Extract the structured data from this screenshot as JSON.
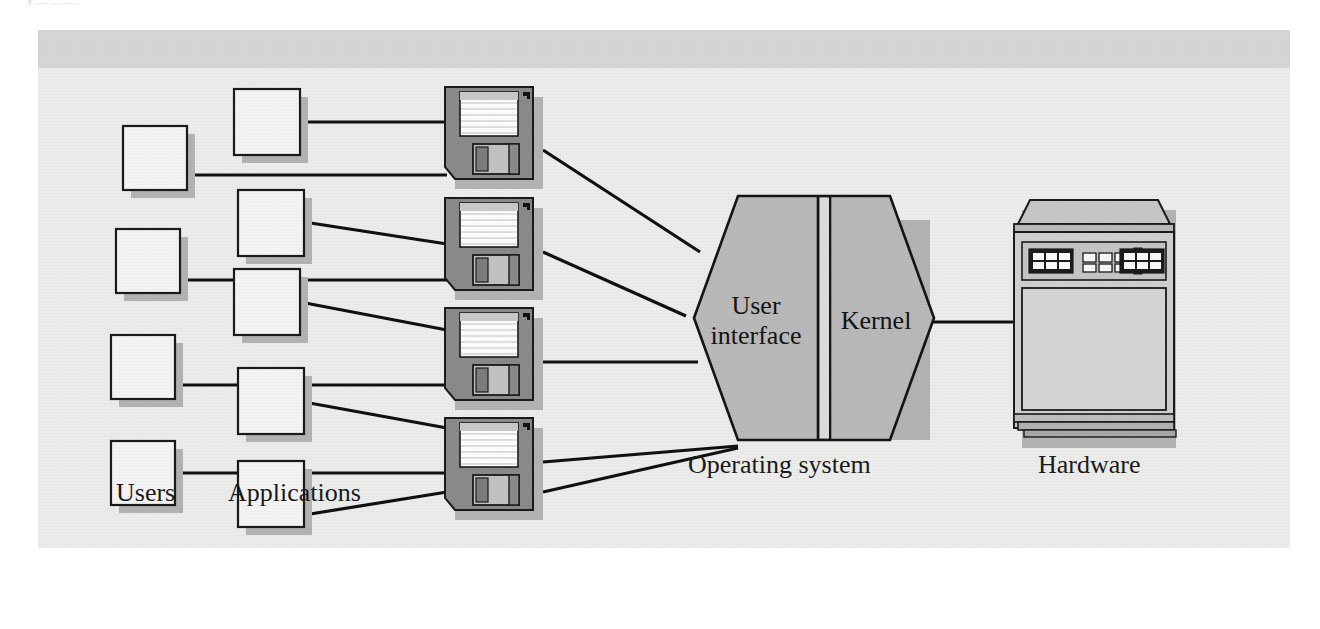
{
  "figure": {
    "clipped_caption": "y ..... .... .....",
    "background_color": "#ececeb",
    "top_band_color": "#d6d6d6",
    "line_color": "#101010",
    "shadow_color": "#b3b3b3"
  },
  "labels": {
    "users": "Users",
    "applications": "Applications",
    "operating_system": "Operating system",
    "hardware": "Hardware"
  },
  "os_block": {
    "user_interface_line1": "User",
    "user_interface_line2": "interface",
    "kernel": "Kernel",
    "fill_color": "#b9b9b9"
  },
  "nodes": {
    "users": [
      {
        "name": "user-box-1",
        "x": 85,
        "y": 96,
        "w": 64,
        "h": 64
      },
      {
        "name": "user-box-2",
        "x": 78,
        "y": 199,
        "w": 64,
        "h": 64
      },
      {
        "name": "user-box-3",
        "x": 73,
        "y": 305,
        "w": 64,
        "h": 64
      },
      {
        "name": "user-box-4",
        "x": 73,
        "y": 411,
        "w": 64,
        "h": 64
      }
    ],
    "applications": [
      {
        "name": "application-box-1",
        "x": 196,
        "y": 59,
        "w": 66,
        "h": 66
      },
      {
        "name": "application-box-2",
        "x": 200,
        "y": 160,
        "w": 66,
        "h": 66
      },
      {
        "name": "application-box-3",
        "x": 196,
        "y": 239,
        "w": 66,
        "h": 66
      },
      {
        "name": "application-box-4",
        "x": 200,
        "y": 338,
        "w": 66,
        "h": 66
      },
      {
        "name": "application-box-5",
        "x": 200,
        "y": 431,
        "w": 66,
        "h": 66
      }
    ],
    "floppies": [
      {
        "name": "floppy-disk-1",
        "x": 407,
        "y": 57,
        "w": 98,
        "h": 102
      },
      {
        "name": "floppy-disk-2",
        "x": 407,
        "y": 168,
        "w": 98,
        "h": 102
      },
      {
        "name": "floppy-disk-3",
        "x": 407,
        "y": 278,
        "w": 98,
        "h": 102
      },
      {
        "name": "floppy-disk-4",
        "x": 407,
        "y": 388,
        "w": 98,
        "h": 102
      }
    ],
    "hexagon": {
      "name": "operating-system-hexagon",
      "cx": 727,
      "cy": 284
    },
    "mainframe": {
      "name": "hardware-mainframe",
      "x": 962,
      "y": 162
    }
  },
  "connections": [
    {
      "from": "user-box-1",
      "to": "floppy-disk-1"
    },
    {
      "from": "application-box-1",
      "to": "floppy-disk-1"
    },
    {
      "from": "application-box-2",
      "to": "floppy-disk-2"
    },
    {
      "from": "user-box-2",
      "to": "floppy-disk-2"
    },
    {
      "from": "application-box-3",
      "to": "floppy-disk-3"
    },
    {
      "from": "user-box-3",
      "to": "floppy-disk-3"
    },
    {
      "from": "application-box-4",
      "to": "floppy-disk-4"
    },
    {
      "from": "user-box-4",
      "to": "application-box-5"
    },
    {
      "from": "application-box-5",
      "to": "floppy-disk-4"
    },
    {
      "from": "floppy-disk-1",
      "to": "operating-system-hexagon"
    },
    {
      "from": "floppy-disk-2",
      "to": "operating-system-hexagon"
    },
    {
      "from": "floppy-disk-3",
      "to": "operating-system-hexagon"
    },
    {
      "from": "floppy-disk-4",
      "to": "operating-system-hexagon"
    },
    {
      "from": "operating-system-hexagon",
      "to": "hardware-mainframe"
    }
  ]
}
